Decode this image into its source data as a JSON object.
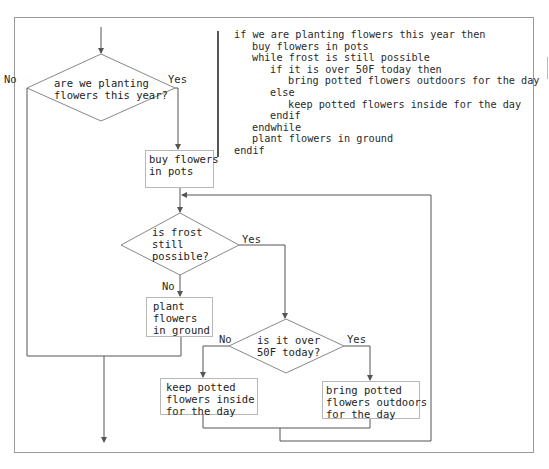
{
  "flowchart": {
    "decisions": [
      {
        "id": "d1",
        "text": "are we planting\nflowers this year?",
        "yes_label": "Yes",
        "no_label": "No"
      },
      {
        "id": "d2",
        "text": "is frost\nstill\npossible?",
        "yes_label": "Yes",
        "no_label": "No"
      },
      {
        "id": "d3",
        "text": "is it over\n50F today?",
        "yes_label": "Yes",
        "no_label": "No"
      }
    ],
    "processes": [
      {
        "id": "p1",
        "text": "buy flowers\nin pots"
      },
      {
        "id": "p2",
        "text": "plant\nflowers\nin ground"
      },
      {
        "id": "p3",
        "text": "keep potted\nflowers inside\nfor the day"
      },
      {
        "id": "p4",
        "text": "bring potted\nflowers outdoors\nfor the day"
      }
    ]
  },
  "pseudocode": {
    "lines": [
      {
        "indent": 0,
        "text": "if we are planting flowers this year then"
      },
      {
        "indent": 1,
        "text": "buy flowers in pots"
      },
      {
        "indent": 1,
        "text": "while frost is still possible"
      },
      {
        "indent": 2,
        "text": "if it is over 50F today then"
      },
      {
        "indent": 3,
        "text": "bring potted flowers outdoors for the day"
      },
      {
        "indent": 2,
        "text": "else"
      },
      {
        "indent": 3,
        "text": "keep potted flowers inside for the day"
      },
      {
        "indent": 2,
        "text": "endif"
      },
      {
        "indent": 1,
        "text": "endwhile"
      },
      {
        "indent": 1,
        "text": "plant flowers in ground"
      },
      {
        "indent": 0,
        "text": "endif"
      }
    ]
  },
  "colors": {
    "line": "#555555",
    "box_border": "#b8b8b8",
    "frame": "#9a9a9a"
  }
}
